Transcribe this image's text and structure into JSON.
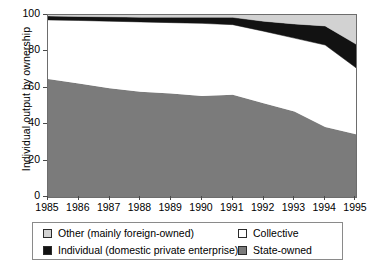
{
  "chart_data": {
    "type": "area",
    "title": "",
    "xlabel": "",
    "ylabel": "Individual output by ownership",
    "xlim": [
      1985,
      1995
    ],
    "ylim": [
      0,
      100
    ],
    "grid": false,
    "stacked": true,
    "legend_position": "bottom",
    "categories": [
      "1985",
      "1986",
      "1987",
      "1988",
      "1989",
      "1990",
      "1991",
      "1992",
      "1993",
      "1994",
      "1995"
    ],
    "x": [
      1985,
      1986,
      1987,
      1988,
      1989,
      1990,
      1991,
      1992,
      1993,
      1994,
      1995
    ],
    "xticks": [
      "1985",
      "1986",
      "1987",
      "1988",
      "1989",
      "1990",
      "1991",
      "1992",
      "1993",
      "1994",
      "1995"
    ],
    "yticks": [
      "0",
      "20",
      "40",
      "60",
      "80",
      "100"
    ],
    "ytick_values": [
      0,
      20,
      40,
      60,
      80,
      100
    ],
    "series": [
      {
        "name": "State-owned",
        "color": "#7b7b7b",
        "order": 1,
        "values": [
          64.9,
          62.3,
          59.7,
          57.8,
          56.8,
          55.5,
          56.2,
          51.5,
          47.0,
          38.5,
          34.5
        ]
      },
      {
        "name": "Collective",
        "color": "#ffffff",
        "order": 2,
        "values": [
          32.4,
          34.7,
          36.9,
          38.4,
          39.0,
          39.9,
          38.5,
          39.6,
          40.3,
          45.0,
          36.5
        ]
      },
      {
        "name": "Individual (domestic private enterprise)",
        "color": "#121212",
        "order": 3,
        "values": [
          2.2,
          2.2,
          2.4,
          2.6,
          3.0,
          3.4,
          4.0,
          5.5,
          7.8,
          10.5,
          13.0
        ]
      },
      {
        "name": "Other (mainly foreign-owned)",
        "color": "#d2d2d2",
        "order": 4,
        "values": [
          0.5,
          0.8,
          1.0,
          1.2,
          1.2,
          1.2,
          1.3,
          3.4,
          4.9,
          6.0,
          16.0
        ]
      }
    ],
    "cumulative_tops": {
      "state_owned": [
        64.9,
        62.3,
        59.7,
        57.8,
        56.8,
        55.5,
        56.2,
        51.5,
        47.0,
        38.5,
        34.5
      ],
      "collective": [
        97.3,
        97.0,
        96.6,
        96.2,
        95.8,
        95.4,
        94.7,
        91.1,
        87.3,
        83.5,
        71.0
      ],
      "individual": [
        99.5,
        99.2,
        99.0,
        98.8,
        98.8,
        98.8,
        98.7,
        96.6,
        95.1,
        94.0,
        84.0
      ],
      "other": [
        100,
        100,
        100,
        100,
        100,
        100,
        100,
        100,
        100,
        100,
        100
      ]
    }
  },
  "legend": {
    "entries": [
      {
        "label": "Other (mainly foreign-owned)",
        "color": "#d2d2d2",
        "row": 0,
        "col": 0
      },
      {
        "label": "Collective",
        "color": "#ffffff",
        "row": 0,
        "col": 1
      },
      {
        "label": "Individual (domestic private enterprise)",
        "color": "#121212",
        "row": 1,
        "col": 0
      },
      {
        "label": "State-owned",
        "color": "#7b7b7b",
        "row": 1,
        "col": 1
      }
    ]
  },
  "colors": {
    "other": "#d2d2d2",
    "collective": "#ffffff",
    "individual": "#121212",
    "state_owned": "#7b7b7b",
    "axis": "#6d6d6d",
    "text": "#000000"
  }
}
